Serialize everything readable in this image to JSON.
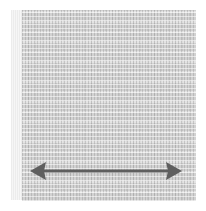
{
  "image": {
    "subject": "fabric swatch",
    "texture": "woven grey fabric",
    "colors": {
      "fabric": "#d2d2d2",
      "arrow": "#5f5f5f",
      "background": "#ffffff"
    },
    "annotation": {
      "type": "double-headed horizontal arrow",
      "icon": "double-arrow-horizontal-icon"
    }
  }
}
